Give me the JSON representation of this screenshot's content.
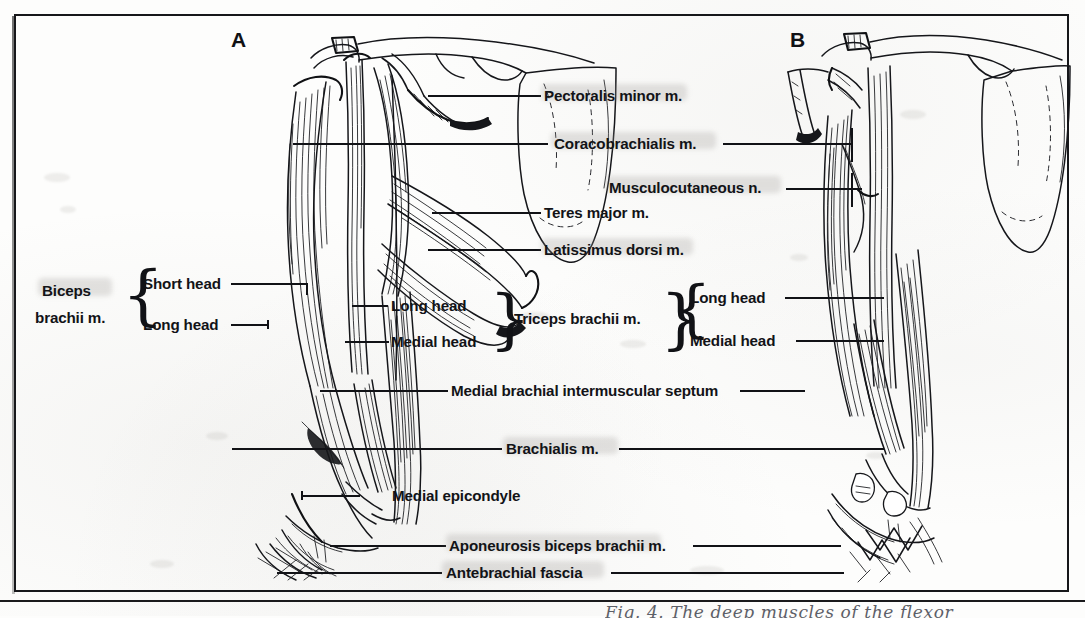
{
  "plate": {
    "panels": [
      {
        "id": "A",
        "letter": "A",
        "name": "panel-a-anterior-arm"
      },
      {
        "id": "B",
        "letter": "B",
        "name": "panel-b-deep-dissection"
      }
    ],
    "handwritten_caption": "Fig. 4. The deep muscles of the flexor"
  },
  "labels": {
    "pectoralis_minor": "Pectoralis minor m.",
    "coracobrachialis": "Coracobrachialis m.",
    "musculocutaneous": "Musculocutaneous n.",
    "teres_major": "Teres major m.",
    "latissimus_dorsi": "Latissimus dorsi m.",
    "biceps_brachii": "Biceps\nbrachii m.",
    "biceps_brachii_line1": "Biceps",
    "biceps_brachii_line2": "brachii m.",
    "short_head": "Short head",
    "long_head_biceps": "Long head",
    "long_head_triceps": "Long head",
    "medial_head_triceps": "Medial head",
    "triceps_brachii": "Triceps brachii m.",
    "long_head_b": "Long head",
    "medial_head_b": "Medial head",
    "medial_brachial_septum": "Medial brachial intermuscular septum",
    "brachialis": "Brachialis m.",
    "medial_epicondyle": "Medial epicondyle",
    "aponeurosis_biceps": "Aponeurosis biceps brachii m.",
    "antebrachial_fascia": "Antebrachial fascia"
  },
  "colors": {
    "ink": "#15161a",
    "paper": "#fdfdfc",
    "frame": "#16171a",
    "highlighter_smudge": "#96948f",
    "handwriting": "#5d6068"
  },
  "icons": {
    "brace_left": "left-curly-brace",
    "brace_right": "right-curly-brace"
  }
}
